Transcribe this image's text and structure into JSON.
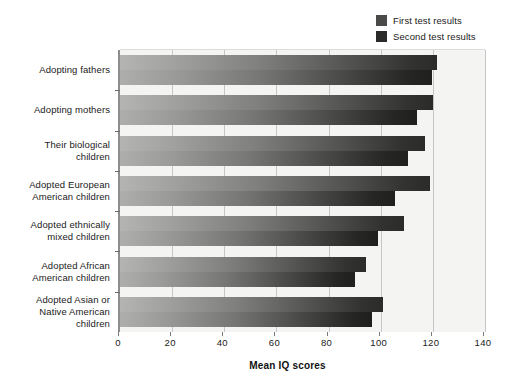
{
  "legend": {
    "position": "top-right",
    "entries": [
      {
        "label": "First test results",
        "color": "#4a4a48"
      },
      {
        "label": "Second test results",
        "color": "#2b2b29"
      }
    ]
  },
  "axis": {
    "x_title": "Mean IQ scores",
    "x_ticks": [
      "0",
      "20",
      "40",
      "60",
      "80",
      "100",
      "120",
      "140"
    ]
  },
  "chart_data": {
    "type": "bar",
    "orientation": "horizontal",
    "title": "",
    "subtitle": "",
    "xlabel": "Mean IQ scores",
    "ylabel": "",
    "xlim": [
      0,
      140
    ],
    "xticks": [
      0,
      20,
      40,
      60,
      80,
      100,
      120,
      140
    ],
    "grid": true,
    "grid_axis": "x",
    "legend_position": "top-right",
    "categories": [
      "Adopting fathers",
      "Adopting mothers",
      "Their biological children",
      "Adopted European American children",
      "Adopted ethnically mixed children",
      "Adopted African American children",
      "Adopted Asian or Native American children"
    ],
    "category_lines": [
      [
        "Adopting fathers"
      ],
      [
        "Adopting mothers"
      ],
      [
        "Their biological",
        "children"
      ],
      [
        "Adopted European",
        "American children"
      ],
      [
        "Adopted ethnically",
        "mixed children"
      ],
      [
        "Adopted African",
        "American children"
      ],
      [
        "Adopted Asian or",
        "Native American",
        "children"
      ]
    ],
    "series": [
      {
        "name": "First test results",
        "color": "#4a4a48",
        "values": [
          121.5,
          120.0,
          117.0,
          119.0,
          109.0,
          94.5,
          101.0
        ]
      },
      {
        "name": "Second test results",
        "color": "#2b2b29",
        "values": [
          119.5,
          114.0,
          110.5,
          105.5,
          99.0,
          90.0,
          96.5
        ]
      }
    ]
  }
}
